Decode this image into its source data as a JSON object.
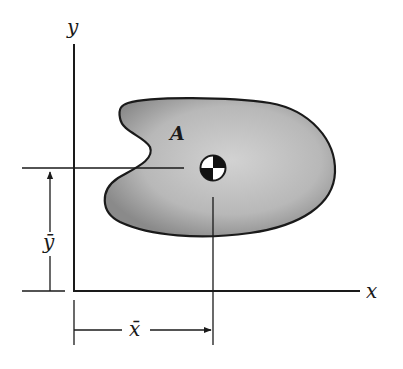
{
  "diagram": {
    "labels": {
      "y_axis": "y",
      "x_axis": "x",
      "area": "A",
      "x_bar": "x̄",
      "y_bar": "ȳ"
    },
    "icons": {
      "centroid": "centroid-symbol"
    },
    "colors": {
      "stroke": "#1a1a1a",
      "fill_light": "#c9c9c9",
      "fill_dark": "#8c8c8c",
      "background": "#ffffff"
    }
  }
}
